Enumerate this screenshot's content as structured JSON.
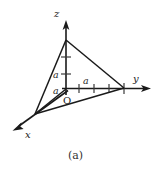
{
  "figure": {
    "caption": "(a)",
    "axes": [
      {
        "name": "z-axis",
        "label": "z",
        "direction": "up",
        "label_x": 55,
        "label_y": 16
      },
      {
        "name": "y-axis",
        "label": "y",
        "direction": "right",
        "label_x": 134,
        "label_y": 82
      },
      {
        "name": "x-axis",
        "label": "x",
        "direction": "down-left",
        "label_x": 25,
        "label_y": 137
      }
    ],
    "origin": {
      "label": "O",
      "x": 63,
      "y": 103,
      "px": 66,
      "py": 89
    },
    "dimension_labels": [
      {
        "name": "z-upper-segment",
        "label": "a",
        "x": 54,
        "y": 75,
        "axis": "z"
      },
      {
        "name": "z-lower-segment",
        "label": "a",
        "x": 54,
        "y": 92,
        "axis": "z"
      },
      {
        "name": "y-first-segment",
        "label": "a",
        "x": 83,
        "y": 81,
        "axis": "y"
      }
    ],
    "colors": {
      "stroke": "#1a1a1a",
      "tick": "#3a3a3a",
      "background": "#ffffff",
      "caption": "#333333"
    },
    "geometry": {
      "origin": [
        66,
        89
      ],
      "z_intercept": [
        66,
        40
      ],
      "y_intercept": [
        124,
        88
      ],
      "x_intercept": [
        35,
        114
      ],
      "z_axis_top": [
        66,
        22
      ],
      "y_axis_end": [
        150,
        88
      ],
      "x_axis_end": [
        13,
        130
      ],
      "z_ticks_y": [
        57,
        74
      ],
      "y_ticks_x": [
        78,
        91,
        104,
        117
      ],
      "unit_note": "each segment marked a"
    }
  }
}
